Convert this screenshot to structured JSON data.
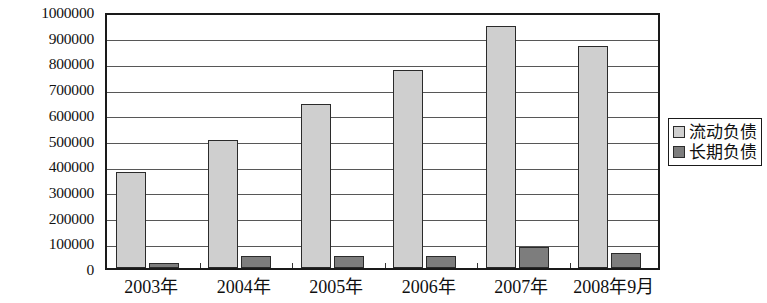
{
  "chart_data": {
    "type": "bar",
    "title": "",
    "xlabel": "",
    "ylabel": "",
    "categories": [
      "2003年",
      "2004年",
      "2005年",
      "2006年",
      "2007年",
      "2008年9月"
    ],
    "series": [
      {
        "name": "流动负债",
        "color": "#cfcfcf",
        "values": [
          375000,
          500000,
          640000,
          770000,
          940000,
          865000
        ]
      },
      {
        "name": "长期负债",
        "color": "#7d7d7d",
        "values": [
          20000,
          45000,
          48000,
          45000,
          80000,
          58000
        ]
      }
    ],
    "ylim": [
      0,
      1000000
    ],
    "ytick_step": 100000,
    "yticks": [
      "0",
      "100000",
      "200000",
      "300000",
      "400000",
      "500000",
      "600000",
      "700000",
      "800000",
      "900000",
      "1000000"
    ],
    "grid": true,
    "legend_position": "right"
  },
  "legend": {
    "items": [
      {
        "label": "流动负债",
        "swatch": "current"
      },
      {
        "label": "长期负债",
        "swatch": "longterm"
      }
    ]
  }
}
